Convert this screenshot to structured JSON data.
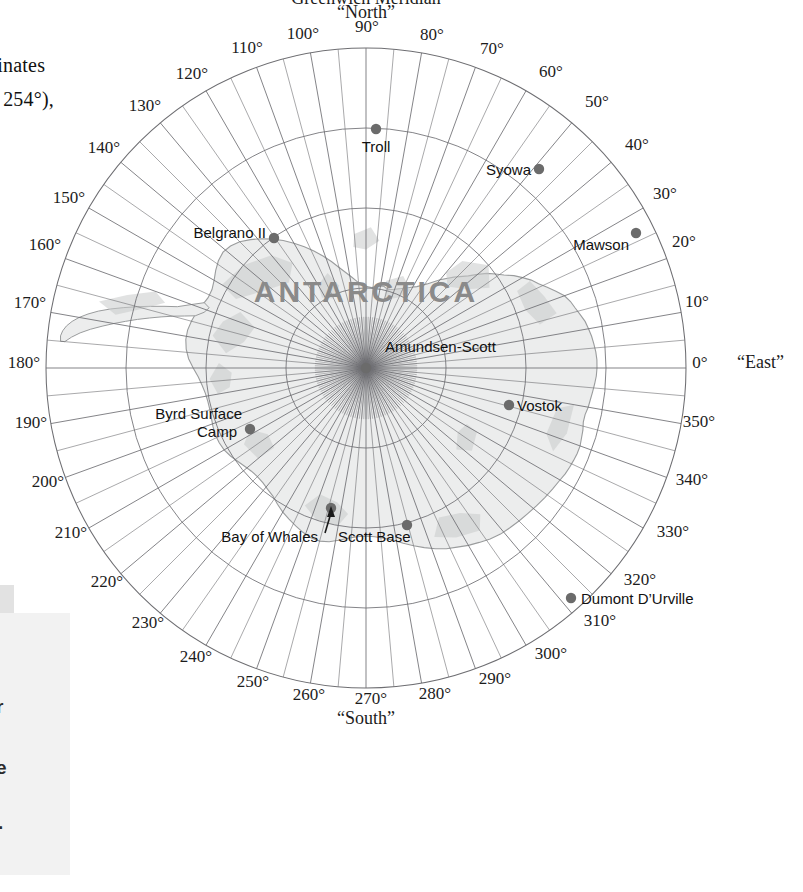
{
  "page": {
    "width": 803,
    "height": 892,
    "background": "#ffffff"
  },
  "margin_text": {
    "line1": "t",
    "line2": "ordinates",
    "line3": "sin 254°),"
  },
  "side_box": {
    "line1": "r",
    "line2": "e",
    "line3": "."
  },
  "map": {
    "center": {
      "x": 366,
      "y": 368
    },
    "outer_radius": 320,
    "top_title_line1": "Greenwich Meridian",
    "top_title_line2": "“North”",
    "continent_label": "ANTARCTICA",
    "cardinals": [
      {
        "name": "north",
        "text": "“North”",
        "x": 366,
        "y": 18
      },
      {
        "name": "east",
        "text": "“East”",
        "x": 737,
        "y": 368
      },
      {
        "name": "south",
        "text": "“South”",
        "x": 366,
        "y": 724
      }
    ],
    "degree_labels": [
      {
        "value": "0°",
        "x": 700,
        "y": 368
      },
      {
        "value": "10°",
        "x": 697,
        "y": 307
      },
      {
        "value": "20°",
        "x": 684,
        "y": 247
      },
      {
        "value": "30°",
        "x": 665,
        "y": 199
      },
      {
        "value": "40°",
        "x": 637,
        "y": 150
      },
      {
        "value": "50°",
        "x": 597,
        "y": 107
      },
      {
        "value": "60°",
        "x": 551,
        "y": 77
      },
      {
        "value": "70°",
        "x": 492,
        "y": 54
      },
      {
        "value": "80°",
        "x": 432,
        "y": 40
      },
      {
        "value": "90°",
        "x": 367,
        "y": 32
      },
      {
        "value": "100°",
        "x": 303,
        "y": 39
      },
      {
        "value": "110°",
        "x": 247,
        "y": 53
      },
      {
        "value": "120°",
        "x": 192,
        "y": 79
      },
      {
        "value": "130°",
        "x": 145,
        "y": 111
      },
      {
        "value": "140°",
        "x": 104,
        "y": 153
      },
      {
        "value": "150°",
        "x": 69,
        "y": 203
      },
      {
        "value": "160°",
        "x": 45,
        "y": 250
      },
      {
        "value": "170°",
        "x": 30,
        "y": 308
      },
      {
        "value": "180°",
        "x": 24,
        "y": 368
      },
      {
        "value": "190°",
        "x": 31,
        "y": 428
      },
      {
        "value": "200°",
        "x": 48,
        "y": 487
      },
      {
        "value": "210°",
        "x": 71,
        "y": 538
      },
      {
        "value": "220°",
        "x": 107,
        "y": 587
      },
      {
        "value": "230°",
        "x": 148,
        "y": 628
      },
      {
        "value": "240°",
        "x": 196,
        "y": 662
      },
      {
        "value": "250°",
        "x": 253,
        "y": 687
      },
      {
        "value": "260°",
        "x": 309,
        "y": 700
      },
      {
        "value": "270°",
        "x": 371,
        "y": 704
      },
      {
        "value": "280°",
        "x": 435,
        "y": 699
      },
      {
        "value": "290°",
        "x": 495,
        "y": 684
      },
      {
        "value": "300°",
        "x": 551,
        "y": 659
      },
      {
        "value": "310°",
        "x": 600,
        "y": 626
      },
      {
        "value": "320°",
        "x": 640,
        "y": 585
      },
      {
        "value": "330°",
        "x": 673,
        "y": 537
      },
      {
        "value": "340°",
        "x": 692,
        "y": 485
      },
      {
        "value": "350°",
        "x": 699,
        "y": 427
      }
    ],
    "stations": [
      {
        "name": "Troll",
        "label": "Troll",
        "dot": {
          "x": 376,
          "y": 129
        },
        "label_x": 376,
        "label_y": 152,
        "anchor": "middle"
      },
      {
        "name": "Syowa",
        "label": "Syowa",
        "dot": {
          "x": 539,
          "y": 169
        },
        "label_x": 531,
        "label_y": 175,
        "anchor": "end"
      },
      {
        "name": "Mawson",
        "label": "Mawson",
        "dot": {
          "x": 636,
          "y": 233
        },
        "label_x": 629,
        "label_y": 250,
        "anchor": "end"
      },
      {
        "name": "Belgrano II",
        "label": "Belgrano II",
        "dot": {
          "x": 274,
          "y": 238
        },
        "label_x": 266,
        "label_y": 238,
        "anchor": "end"
      },
      {
        "name": "Amundsen-Scott",
        "label": "Amundsen-Scott",
        "dot": {
          "x": 366,
          "y": 368
        },
        "label_x": 385,
        "label_y": 352,
        "anchor": "start"
      },
      {
        "name": "Vostok",
        "label": "Vostok",
        "dot": {
          "x": 509,
          "y": 405
        },
        "label_x": 517,
        "label_y": 411,
        "anchor": "start"
      },
      {
        "name": "Byrd Surface Camp",
        "label": "Byrd Surface",
        "dot": {
          "x": 250,
          "y": 429
        },
        "label_x": 242,
        "label_y": 419,
        "anchor": "end"
      },
      {
        "name": "Byrd Camp Line2",
        "label": "Camp",
        "dot": null,
        "label_x": 217,
        "label_y": 437,
        "anchor": "middle"
      },
      {
        "name": "Bay of Whales",
        "label": "Bay of Whales",
        "dot": {
          "x": 331,
          "y": 508
        },
        "label_x": 318,
        "label_y": 542,
        "anchor": "end"
      },
      {
        "name": "Scott Base",
        "label": "Scott Base",
        "dot": {
          "x": 407,
          "y": 525
        },
        "label_x": 338,
        "label_y": 542,
        "anchor": "start"
      },
      {
        "name": "Dumont D'Urville",
        "label": "Dumont D’Urville",
        "dot": {
          "x": 571,
          "y": 598
        },
        "label_x": 581,
        "label_y": 604,
        "anchor": "start"
      }
    ],
    "grid": {
      "latitude_circles_radii": [
        80,
        160,
        240,
        320
      ],
      "meridian_spacing_degrees": 10,
      "fine_meridian_spacing_degrees": 5
    },
    "colors": {
      "grid": "#6e6e72",
      "ice": "#eceded",
      "rock": "#c9cacb",
      "coast": "#9a9c9d",
      "station_dot": "#6b6b6b",
      "continent_label": "#8a8a8a"
    }
  }
}
